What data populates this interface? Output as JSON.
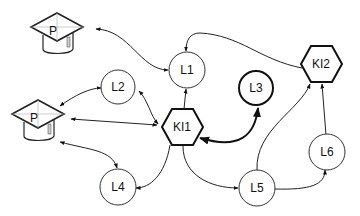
{
  "diagram": {
    "nodes": {
      "p1": {
        "label": "P",
        "type": "graduation-cap"
      },
      "p2": {
        "label": "P",
        "type": "graduation-cap"
      },
      "l1": {
        "label": "L1",
        "type": "circle"
      },
      "l2": {
        "label": "L2",
        "type": "circle"
      },
      "l3": {
        "label": "L3",
        "type": "circle-bold"
      },
      "l4": {
        "label": "L4",
        "type": "circle"
      },
      "l5": {
        "label": "L5",
        "type": "circle"
      },
      "l6": {
        "label": "L6",
        "type": "circle"
      },
      "ki1": {
        "label": "KI1",
        "type": "hexagon"
      },
      "ki2": {
        "label": "KI2",
        "type": "hexagon"
      }
    },
    "edges": [
      {
        "from": "p1",
        "to": "l1",
        "direction": "both"
      },
      {
        "from": "p2",
        "to": "l2",
        "direction": "both"
      },
      {
        "from": "p2",
        "to": "ki1",
        "direction": "both"
      },
      {
        "from": "p2",
        "to": "l4",
        "direction": "both"
      },
      {
        "from": "l2",
        "to": "ki1",
        "direction": "both"
      },
      {
        "from": "ki1",
        "to": "l1",
        "direction": "forward"
      },
      {
        "from": "ki1",
        "to": "l3",
        "direction": "both",
        "bold": true
      },
      {
        "from": "ki1",
        "to": "l4",
        "direction": "forward"
      },
      {
        "from": "ki1",
        "to": "l5",
        "direction": "forward"
      },
      {
        "from": "ki2",
        "to": "l1",
        "direction": "forward"
      },
      {
        "from": "l5",
        "to": "ki2",
        "direction": "forward"
      },
      {
        "from": "l5",
        "to": "l6",
        "direction": "forward"
      },
      {
        "from": "l6",
        "to": "ki2",
        "direction": "forward"
      }
    ]
  }
}
